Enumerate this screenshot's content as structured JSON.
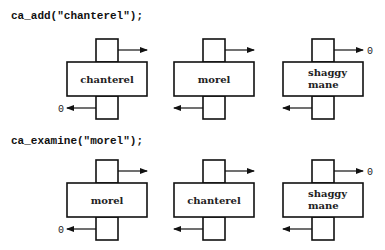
{
  "rows": [
    {
      "call": "ca_add(\"chanterel\");",
      "nodes": [
        {
          "label_lines": [
            "chanterel"
          ],
          "left_null": "0",
          "right_null": ""
        },
        {
          "label_lines": [
            "morel"
          ],
          "left_null": "",
          "right_null": ""
        },
        {
          "label_lines": [
            "shaggy",
            "mane"
          ],
          "left_null": "",
          "right_null": "0"
        }
      ]
    },
    {
      "call": "ca_examine(\"morel\");",
      "nodes": [
        {
          "label_lines": [
            "morel"
          ],
          "left_null": "0",
          "right_null": ""
        },
        {
          "label_lines": [
            "chanterel"
          ],
          "left_null": "",
          "right_null": ""
        },
        {
          "label_lines": [
            "shaggy",
            "mane"
          ],
          "left_null": "",
          "right_null": "0"
        }
      ]
    }
  ]
}
